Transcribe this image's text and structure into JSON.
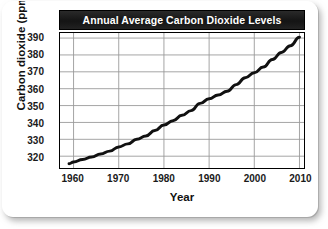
{
  "chart_data": {
    "type": "line",
    "title": "Annual Average Carbon Dioxide Levels",
    "xlabel": "Year",
    "ylabel": "Carbon dioxide (ppm)",
    "xlim": [
      1957,
      2011
    ],
    "ylim": [
      313,
      393
    ],
    "xticks": [
      1960,
      1970,
      1980,
      1990,
      2000,
      2010
    ],
    "xtick_labels": [
      "1960",
      "1970",
      "1980",
      "1990",
      "2000",
      "2010"
    ],
    "yticks": [
      320,
      330,
      340,
      350,
      360,
      370,
      380,
      390
    ],
    "ytick_labels": [
      "320",
      "330",
      "340",
      "350",
      "360",
      "370",
      "380",
      "390"
    ],
    "grid": "both",
    "legend": "none",
    "series": [
      {
        "name": "Annual average CO2 concentration",
        "units": "ppm",
        "line_color": "#111111",
        "line_width": 3,
        "x": [
          1959,
          1960,
          1962,
          1964,
          1966,
          1968,
          1970,
          1972,
          1974,
          1976,
          1978,
          1980,
          1982,
          1984,
          1986,
          1988,
          1990,
          1992,
          1994,
          1996,
          1998,
          2000,
          2002,
          2004,
          2006,
          2008,
          2010
        ],
        "values": [
          315.5,
          316.5,
          318.0,
          319.5,
          321.3,
          323.0,
          325.5,
          327.3,
          330.0,
          332.0,
          335.2,
          338.5,
          341.0,
          344.2,
          347.0,
          351.3,
          354.0,
          356.2,
          358.5,
          362.4,
          366.5,
          369.4,
          372.8,
          377.3,
          381.5,
          385.5,
          390.5
        ]
      }
    ]
  }
}
